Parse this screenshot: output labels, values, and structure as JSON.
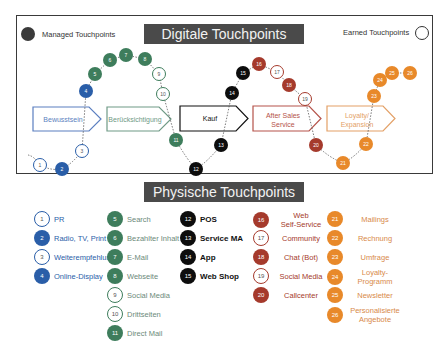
{
  "legend": {
    "managed_label": "Managed Touchpoints",
    "earned_label": "Earned Touchpoints"
  },
  "titles": {
    "digital": "Digitale Touchpoints",
    "physical": "Physische Touchpoints"
  },
  "colors": {
    "blue": "#2a5ea8",
    "green": "#3e7d5c",
    "black": "#0d0d0d",
    "red": "#a53a2c",
    "orange": "#e8892a",
    "title_bg": "#4a4a4a"
  },
  "phases": [
    {
      "label": "Bewusstsein",
      "color": "#5b7fc0"
    },
    {
      "label": "Berücksichtigung",
      "color": "#6f9a86"
    },
    {
      "label": "Kauf",
      "color": "#111111"
    },
    {
      "label_line1": "After Sales",
      "label_line2": "Service",
      "color": "#b5534a"
    },
    {
      "label_line1": "Loyalty/",
      "label_line2": "Expansion",
      "color": "#e3a066"
    }
  ],
  "nodes": [
    {
      "n": "1",
      "x": 40,
      "y": 165,
      "type": "earned",
      "color": "blue"
    },
    {
      "n": "2",
      "x": 62,
      "y": 169,
      "type": "managed",
      "color": "blue"
    },
    {
      "n": "3",
      "x": 82,
      "y": 151,
      "type": "earned",
      "color": "blue"
    },
    {
      "n": "4",
      "x": 86,
      "y": 91,
      "type": "managed",
      "color": "blue"
    },
    {
      "n": "5",
      "x": 95,
      "y": 74,
      "type": "managed",
      "color": "green"
    },
    {
      "n": "6",
      "x": 110,
      "y": 60,
      "type": "managed",
      "color": "green"
    },
    {
      "n": "7",
      "x": 126,
      "y": 55,
      "type": "managed",
      "color": "green"
    },
    {
      "n": "8",
      "x": 145,
      "y": 59,
      "type": "managed",
      "color": "green"
    },
    {
      "n": "9",
      "x": 159,
      "y": 74,
      "type": "earned",
      "color": "green"
    },
    {
      "n": "10",
      "x": 163,
      "y": 94,
      "type": "earned",
      "color": "green"
    },
    {
      "n": "11",
      "x": 176,
      "y": 140,
      "type": "managed",
      "color": "green"
    },
    {
      "n": "12",
      "x": 196,
      "y": 169,
      "type": "managed",
      "color": "black"
    },
    {
      "n": "13",
      "x": 221,
      "y": 145,
      "type": "managed",
      "color": "black"
    },
    {
      "n": "14",
      "x": 232,
      "y": 93,
      "type": "managed",
      "color": "black"
    },
    {
      "n": "15",
      "x": 243,
      "y": 73,
      "type": "managed",
      "color": "black"
    },
    {
      "n": "16",
      "x": 259,
      "y": 64,
      "type": "managed",
      "color": "red"
    },
    {
      "n": "17",
      "x": 277,
      "y": 72,
      "type": "earned",
      "color": "red"
    },
    {
      "n": "18",
      "x": 289,
      "y": 85,
      "type": "managed",
      "color": "red"
    },
    {
      "n": "19",
      "x": 305,
      "y": 99,
      "type": "earned",
      "color": "red"
    },
    {
      "n": "20",
      "x": 316,
      "y": 145,
      "type": "managed",
      "color": "red"
    },
    {
      "n": "21",
      "x": 343,
      "y": 163,
      "type": "managed",
      "color": "orange"
    },
    {
      "n": "22",
      "x": 366,
      "y": 144,
      "type": "managed",
      "color": "orange"
    },
    {
      "n": "23",
      "x": 374,
      "y": 96,
      "type": "managed",
      "color": "orange"
    },
    {
      "n": "24",
      "x": 380,
      "y": 80,
      "type": "managed",
      "color": "orange"
    },
    {
      "n": "25",
      "x": 392,
      "y": 73,
      "type": "managed",
      "color": "orange"
    },
    {
      "n": "26",
      "x": 410,
      "y": 73,
      "type": "managed",
      "color": "orange"
    }
  ],
  "lists": {
    "blue": [
      {
        "n": "1",
        "label": "PR",
        "type": "earned"
      },
      {
        "n": "2",
        "label": "Radio, TV, Print",
        "type": "managed"
      },
      {
        "n": "3",
        "label": "Weiterempfehlung",
        "type": "earned"
      },
      {
        "n": "4",
        "label": "Online-Display",
        "type": "managed"
      }
    ],
    "green": [
      {
        "n": "5",
        "label": "Search",
        "type": "managed"
      },
      {
        "n": "6",
        "label": "Bezahlter Inhalt",
        "type": "managed"
      },
      {
        "n": "7",
        "label": "E-Mail",
        "type": "managed"
      },
      {
        "n": "8",
        "label": "Webseite",
        "type": "managed"
      },
      {
        "n": "9",
        "label": "Social Media",
        "type": "earned"
      },
      {
        "n": "10",
        "label": "Drittseiten",
        "type": "earned"
      },
      {
        "n": "11",
        "label": "Direct Mail",
        "type": "managed"
      }
    ],
    "black": [
      {
        "n": "12",
        "label": "POS",
        "type": "managed"
      },
      {
        "n": "13",
        "label": "Service MA",
        "type": "managed"
      },
      {
        "n": "14",
        "label": "App",
        "type": "managed"
      },
      {
        "n": "15",
        "label": "Web Shop",
        "type": "managed"
      }
    ],
    "red": [
      {
        "n": "16",
        "label_line1": "Web",
        "label_line2": "Self-Service",
        "type": "managed"
      },
      {
        "n": "17",
        "label": "Community",
        "type": "earned"
      },
      {
        "n": "18",
        "label": "Chat (Bot)",
        "type": "managed"
      },
      {
        "n": "19",
        "label": "Social Media",
        "type": "earned"
      },
      {
        "n": "20",
        "label": "Callcenter",
        "type": "managed"
      }
    ],
    "orange": [
      {
        "n": "21",
        "label": "Mailings",
        "type": "managed"
      },
      {
        "n": "22",
        "label": "Rechnung",
        "type": "managed"
      },
      {
        "n": "23",
        "label": "Umfrage",
        "type": "managed"
      },
      {
        "n": "24",
        "label_line1": "Loyalty-",
        "label_line2": "Programm",
        "type": "managed"
      },
      {
        "n": "25",
        "label": "Newsletter",
        "type": "managed"
      },
      {
        "n": "26",
        "label_line1": "Personalisierte",
        "label_line2": "Angebote",
        "type": "managed"
      }
    ]
  }
}
